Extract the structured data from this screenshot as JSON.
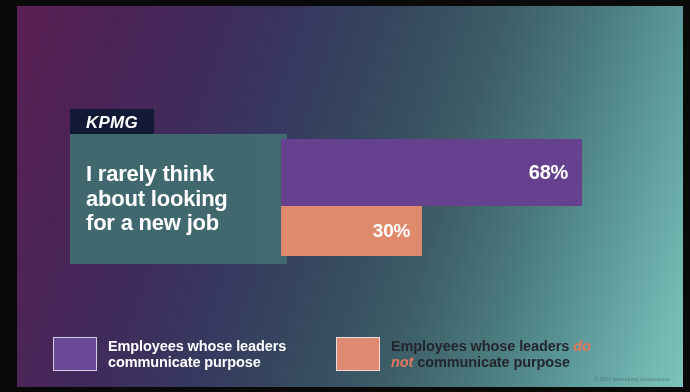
{
  "brand": {
    "logo_text": "KPMG"
  },
  "statement": {
    "text": "I rarely think\nabout looking\nfor a new job"
  },
  "chart_data": {
    "type": "bar",
    "orientation": "horizontal",
    "title": "I rarely think about looking for a new job",
    "xlabel": "",
    "ylabel": "",
    "xlim": [
      0,
      100
    ],
    "grid": false,
    "legend_position": "bottom",
    "categories": [
      "I rarely think about looking for a new job"
    ],
    "series": [
      {
        "name": "Employees whose leaders communicate purpose",
        "values": [
          68
        ],
        "labels": [
          "68%"
        ],
        "color": "#66418f"
      },
      {
        "name": "Employees whose leaders do not communicate purpose",
        "values": [
          30
        ],
        "labels": [
          "30%"
        ],
        "color": "#e08a6c"
      }
    ]
  },
  "bars": {
    "purple": {
      "value_label": "68%"
    },
    "orange": {
      "value_label": "30%"
    }
  },
  "legend": {
    "purple": {
      "label": "Employees whose leaders communicate purpose",
      "line1": "Employees whose leaders",
      "line2": "communicate purpose",
      "color": "#6b4a99"
    },
    "orange": {
      "label": "Employees whose leaders do not communicate purpose",
      "line1_plain": "Employees whose leaders ",
      "line1_emph": "do",
      "line2_emph": "not",
      "line2_plain": " communicate purpose",
      "color": "#e08a72",
      "emphasis_color": "#e2775f"
    }
  },
  "footer": {
    "copyright": "© 2023 www.kpmg.com/purpose"
  },
  "colors": {
    "gradient_start": "#5a1f55",
    "gradient_end": "#7cc3bd",
    "statement_box": "#41686f",
    "logo_box": "#111936",
    "bar_purple": "#66418f",
    "bar_orange": "#e08a6c"
  }
}
